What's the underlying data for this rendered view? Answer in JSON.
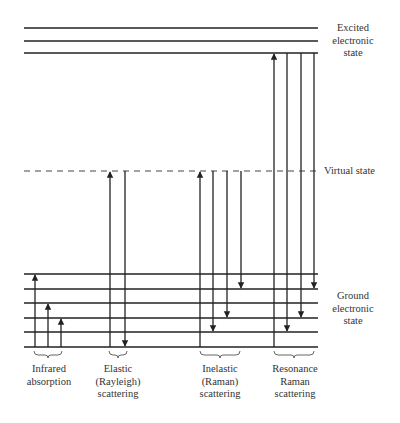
{
  "diagram": {
    "states": {
      "excited": {
        "label_lines": [
          "Excited",
          "electronic",
          "state"
        ],
        "levels_y": [
          28,
          41,
          53
        ]
      },
      "virtual": {
        "label": "Virtual state",
        "y": 171
      },
      "ground": {
        "label_lines": [
          "Ground",
          "electronic",
          "state"
        ],
        "levels_y": [
          274,
          289,
          303,
          318,
          332,
          347
        ]
      }
    },
    "groups": [
      {
        "name": "infrared",
        "label_lines": [
          "Infrared",
          "absorption"
        ]
      },
      {
        "name": "rayleigh",
        "label_lines": [
          "Elastic",
          "(Rayleigh)",
          "scattering"
        ]
      },
      {
        "name": "raman",
        "label_lines": [
          "Inelastic",
          "(Raman)",
          "scattering"
        ]
      },
      {
        "name": "resonance-raman",
        "label_lines": [
          "Resonance",
          "Raman",
          "scattering"
        ]
      }
    ],
    "colors": {
      "line": "#222222",
      "text": "#333333"
    }
  }
}
